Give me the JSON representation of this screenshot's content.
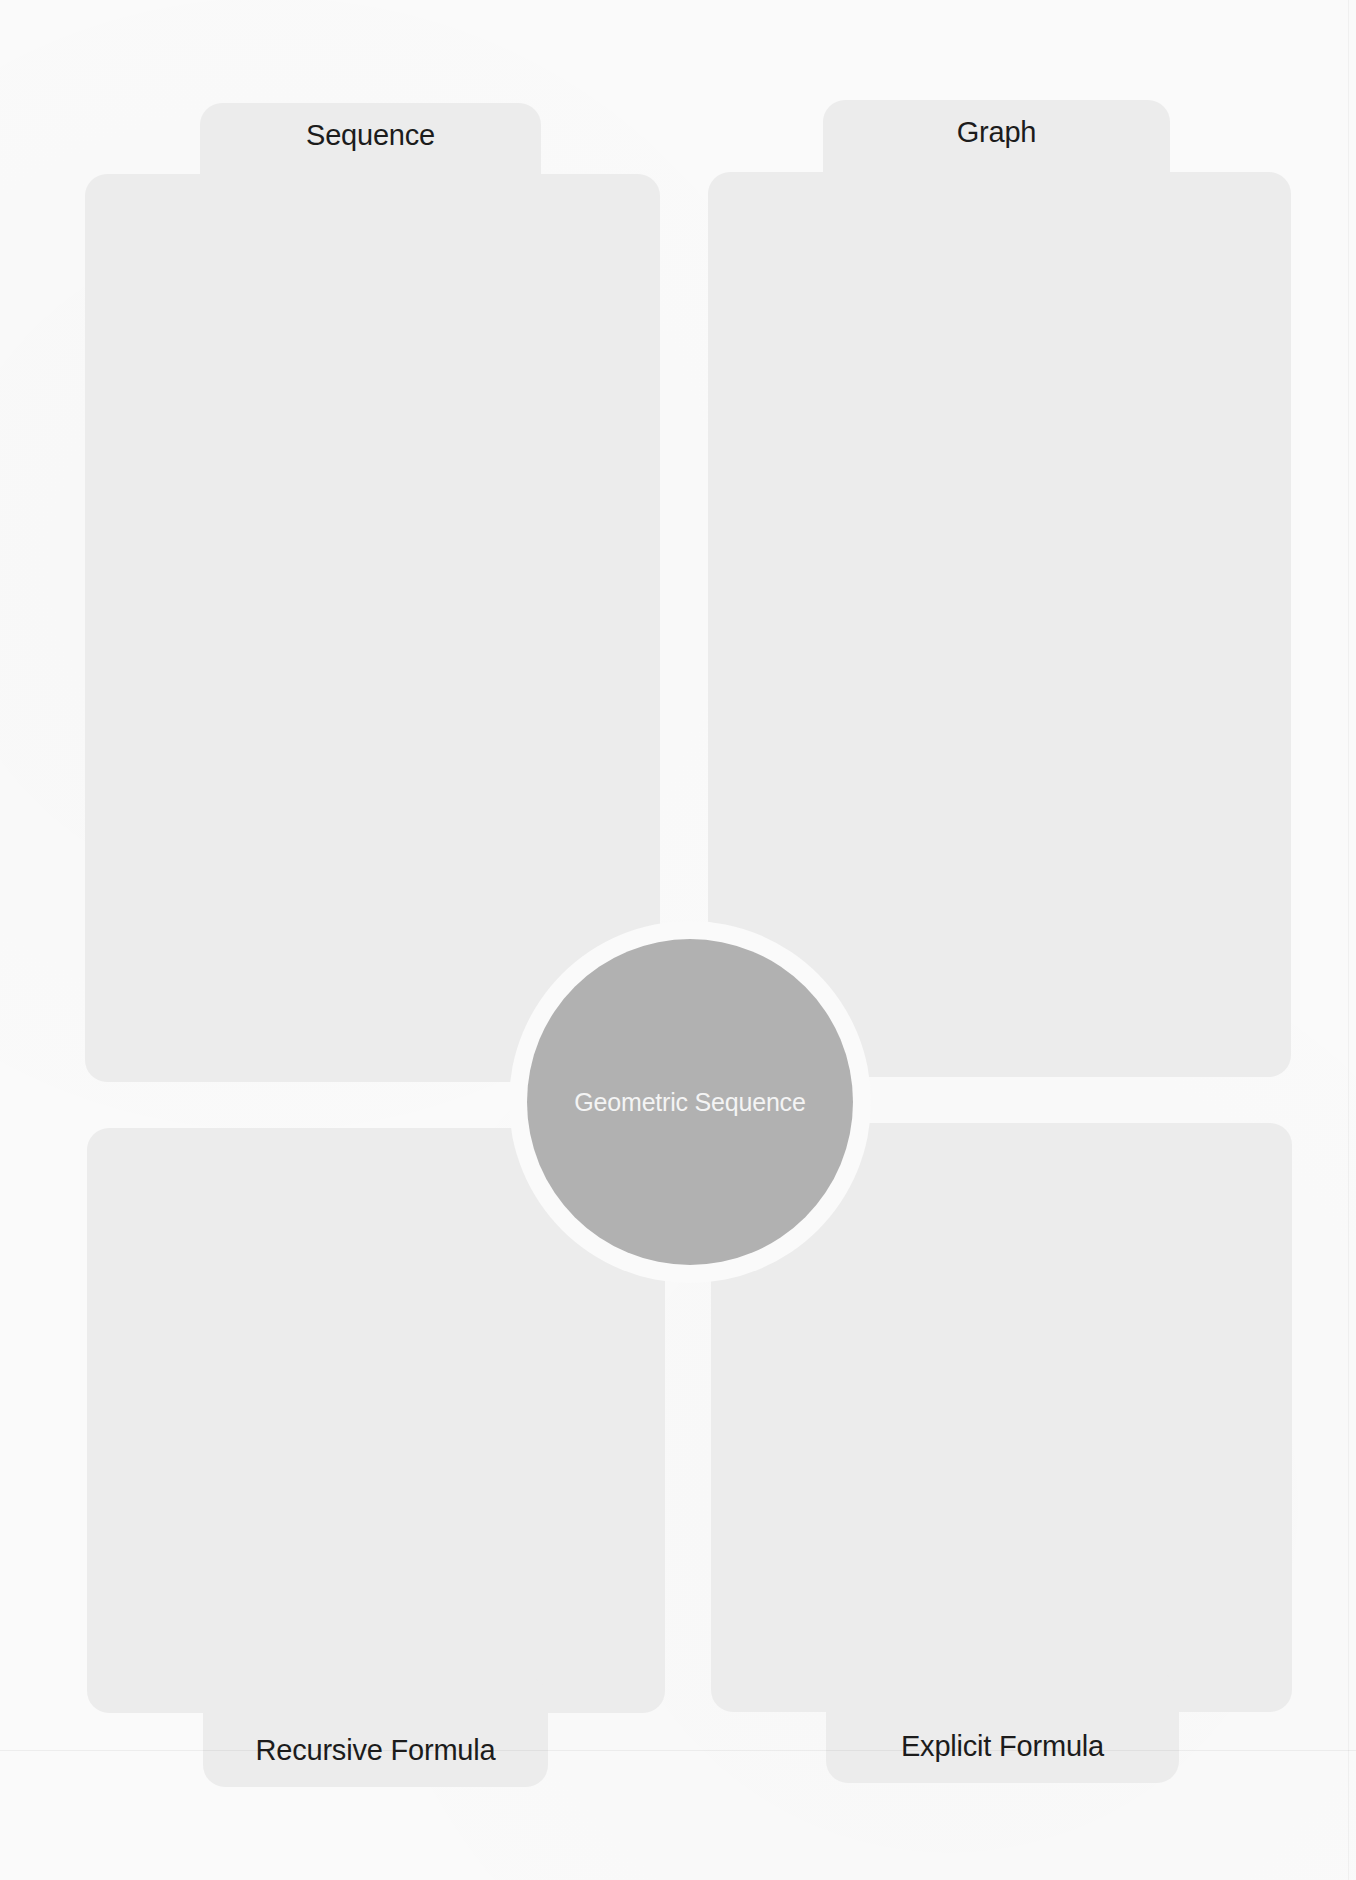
{
  "diagram": {
    "type": "four-square graphic organizer",
    "center": {
      "label": "Geometric Sequence"
    },
    "quadrants": [
      {
        "position": "top-left",
        "label": "Sequence",
        "content": ""
      },
      {
        "position": "top-right",
        "label": "Graph",
        "content": ""
      },
      {
        "position": "bottom-left",
        "label": "Recursive Formula",
        "content": ""
      },
      {
        "position": "bottom-right",
        "label": "Explicit Formula",
        "content": ""
      }
    ]
  },
  "colors": {
    "page_background": "#fafafa",
    "panel_fill": "#ececec",
    "center_fill": "#b1b1b1",
    "center_text": "#f4f4f4",
    "label_text": "#1c1c1c"
  }
}
